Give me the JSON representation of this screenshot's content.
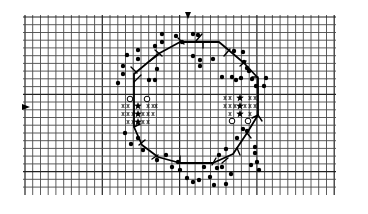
{
  "diagram": {
    "type": "cross-stitch-chart",
    "grid": {
      "x_start": 25,
      "x_end": 334,
      "y_start": 17,
      "y_end": 190,
      "pitch": 7.73,
      "major_every": 10,
      "line_color": "#4a4a4a"
    },
    "center_markers": {
      "top_arrow": {
        "x": 188,
        "y": 14,
        "symbol": "down-triangle"
      },
      "left_arrow": {
        "x": 24,
        "y": 107,
        "symbol": "right-triangle"
      }
    },
    "octagon_path": [
      [
        134,
        74
      ],
      [
        158,
        54
      ],
      [
        180,
        42
      ],
      [
        219,
        42
      ],
      [
        244,
        63
      ],
      [
        258,
        78
      ],
      [
        258,
        95
      ],
      [
        258,
        115
      ],
      [
        247,
        133
      ],
      [
        233,
        154
      ],
      [
        213,
        163
      ],
      [
        180,
        163
      ],
      [
        158,
        157
      ],
      [
        142,
        145
      ],
      [
        134,
        127
      ],
      [
        134,
        107
      ],
      [
        134,
        85
      ],
      [
        134,
        74
      ]
    ],
    "ticks": [
      [
        131,
        67,
        137,
        73
      ],
      [
        141,
        75,
        134,
        82
      ],
      [
        155,
        50,
        162,
        56
      ],
      [
        150,
        61,
        158,
        55
      ],
      [
        178,
        38,
        184,
        44
      ],
      [
        202,
        34,
        196,
        41
      ],
      [
        203,
        42,
        203,
        48
      ],
      [
        230,
        49,
        224,
        56
      ],
      [
        240,
        66,
        246,
        61
      ],
      [
        252,
        77,
        258,
        77
      ],
      [
        258,
        115,
        262,
        121
      ],
      [
        252,
        118,
        258,
        115
      ],
      [
        247,
        133,
        251,
        138
      ],
      [
        237,
        148,
        240,
        155
      ],
      [
        228,
        158,
        222,
        163
      ],
      [
        212,
        165,
        216,
        158
      ],
      [
        180,
        163,
        180,
        156
      ],
      [
        152,
        159,
        158,
        155
      ],
      [
        145,
        140,
        139,
        145
      ],
      [
        134,
        127,
        140,
        124
      ]
    ],
    "dots": [
      [
        118,
        83
      ],
      [
        123,
        74
      ],
      [
        123,
        66
      ],
      [
        127,
        55
      ],
      [
        138,
        50
      ],
      [
        138,
        59
      ],
      [
        155,
        46
      ],
      [
        162,
        34
      ],
      [
        162,
        42
      ],
      [
        149,
        80
      ],
      [
        155,
        80
      ],
      [
        157,
        69
      ],
      [
        176,
        36
      ],
      [
        193,
        34
      ],
      [
        198,
        35
      ],
      [
        182,
        42
      ],
      [
        193,
        56
      ],
      [
        200,
        60
      ],
      [
        200,
        66
      ],
      [
        213,
        59
      ],
      [
        234,
        51
      ],
      [
        243,
        52
      ],
      [
        244,
        62
      ],
      [
        222,
        77
      ],
      [
        232,
        77
      ],
      [
        241,
        78
      ],
      [
        236,
        80
      ],
      [
        247,
        68
      ],
      [
        249,
        71
      ],
      [
        252,
        79
      ],
      [
        256,
        86
      ],
      [
        266,
        78
      ],
      [
        264,
        86
      ],
      [
        125,
        133
      ],
      [
        138,
        138
      ],
      [
        131,
        144
      ],
      [
        143,
        150
      ],
      [
        157,
        160
      ],
      [
        166,
        155
      ],
      [
        172,
        167
      ],
      [
        178,
        162
      ],
      [
        180,
        170
      ],
      [
        187,
        178
      ],
      [
        193,
        182
      ],
      [
        199,
        180
      ],
      [
        204,
        167
      ],
      [
        210,
        177
      ],
      [
        214,
        185
      ],
      [
        217,
        168
      ],
      [
        219,
        155
      ],
      [
        226,
        149
      ],
      [
        237,
        138
      ],
      [
        243,
        129
      ],
      [
        247,
        131
      ],
      [
        255,
        147
      ],
      [
        255,
        153
      ],
      [
        257,
        162
      ],
      [
        259,
        170
      ],
      [
        231,
        174
      ],
      [
        226,
        184
      ],
      [
        222,
        167
      ],
      [
        251,
        165
      ]
    ],
    "hollow_circles": [
      [
        130,
        99
      ],
      [
        147,
        99
      ],
      [
        232,
        121
      ],
      [
        248,
        121
      ]
    ],
    "stars": [
      [
        138,
        106
      ],
      [
        138,
        114
      ],
      [
        138,
        122
      ],
      [
        240,
        98
      ],
      [
        240,
        106
      ],
      [
        240,
        114
      ]
    ],
    "backstitch_glyphs": [
      [
        123,
        106
      ],
      [
        128,
        106
      ],
      [
        148,
        106
      ],
      [
        153,
        106
      ],
      [
        156,
        106
      ],
      [
        123,
        114
      ],
      [
        128,
        114
      ],
      [
        133,
        114
      ],
      [
        143,
        114
      ],
      [
        148,
        114
      ],
      [
        153,
        114
      ],
      [
        128,
        122
      ],
      [
        133,
        122
      ],
      [
        143,
        122
      ],
      [
        148,
        122
      ],
      [
        225,
        98
      ],
      [
        230,
        98
      ],
      [
        250,
        98
      ],
      [
        255,
        98
      ],
      [
        225,
        106
      ],
      [
        230,
        106
      ],
      [
        235,
        106
      ],
      [
        245,
        106
      ],
      [
        250,
        106
      ],
      [
        255,
        106
      ],
      [
        230,
        114
      ],
      [
        250,
        114
      ]
    ]
  }
}
